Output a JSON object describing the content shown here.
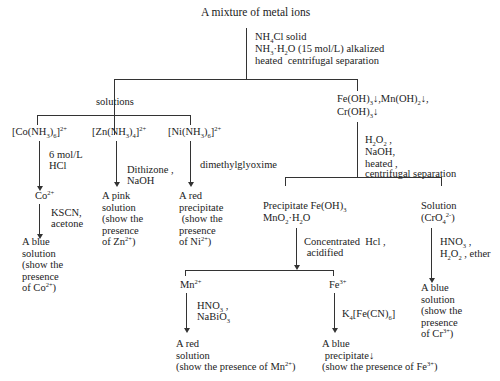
{
  "title": "A mixture of metal ions",
  "step1": {
    "reagents": [
      "NH4Cl solid",
      "NH3·H2O (15 mol/L) alkalized",
      "heated  centrifugal separation"
    ]
  },
  "solutions": {
    "label": "solutions",
    "ions": [
      {
        "name": "[Co(NH3)6]2+",
        "reagent1": [
          "6 mol/L",
          "HCl"
        ],
        "intermediate": "Co2+",
        "reagent2": [
          "KSCN,",
          "acetone"
        ],
        "result": [
          "A blue",
          "solution",
          "(show the",
          "presence",
          "of Co2+)"
        ]
      },
      {
        "name": "[Zn(NH3)4]2+",
        "reagent": [
          "Dithizone ,",
          "NaOH"
        ],
        "result": [
          "A pink",
          "solution",
          "(show the",
          "presence",
          "of Zn2+)"
        ]
      },
      {
        "name": "[Ni(NH3)6]2+",
        "reagent": [
          "dimethylglyoxime"
        ],
        "result": [
          "A red",
          "precipitate",
          " (show the",
          "presence",
          "of Ni2+)"
        ]
      }
    ]
  },
  "precipitates": {
    "label": [
      "Fe(OH)3↓,Mn(OH)2↓,",
      "Cr(OH)3↓"
    ],
    "reagents": [
      "H2O2 ,",
      "NaOH,",
      "heated ,",
      "centrifugal separation"
    ],
    "precipitate_branch": {
      "label": [
        "Precipitate Fe(OH)3",
        "MnO2·H2O"
      ],
      "reagents": [
        "Concentrated  Hcl ,",
        " acidified"
      ],
      "mn": {
        "ion": "Mn2+",
        "reagents": [
          "HNO3 ,",
          "NaBiO3"
        ],
        "result": [
          "A red",
          "solution",
          "(show the presence of Mn2+)"
        ]
      },
      "fe": {
        "ion": "Fe3+",
        "reagents": [
          "K4[Fe(CN)6]"
        ],
        "result": [
          "A blue",
          " precipitate↓",
          "(show the presence of Fe3+)"
        ]
      }
    },
    "solution_branch": {
      "label": [
        "Solution",
        "(CrO42-)"
      ],
      "reagents": [
        "HNO3 ,",
        "H2O2 , ether"
      ],
      "result": [
        "A blue",
        "solution",
        "(show the",
        "presence",
        "of Cr3+)"
      ]
    }
  }
}
